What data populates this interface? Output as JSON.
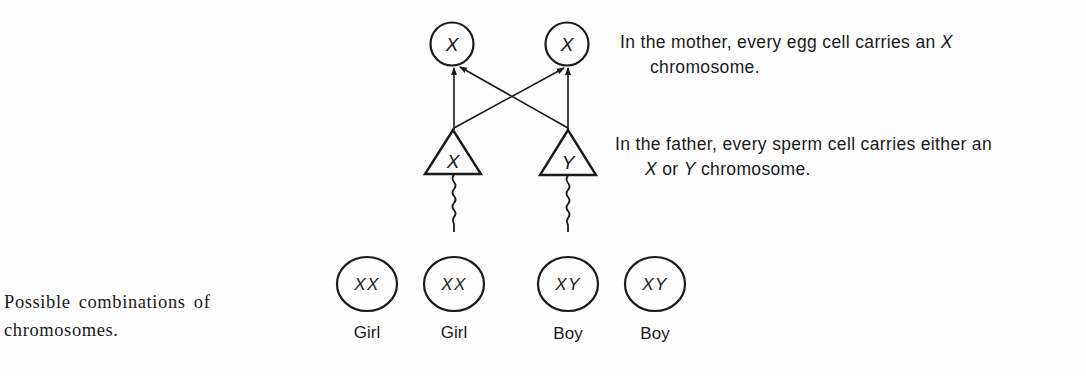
{
  "diagram": {
    "colors": {
      "background": "#fdfdfd",
      "ink": "#1a1a1a"
    },
    "mother": {
      "egg_cells": [
        {
          "label": "X",
          "shape": "circle"
        },
        {
          "label": "X",
          "shape": "circle"
        }
      ],
      "description_line1": "In the mother, every egg cell carries an ",
      "description_line1_italic": "X",
      "description_line2": "chromosome."
    },
    "father": {
      "sperm_cells": [
        {
          "label": "X",
          "shape": "triangle"
        },
        {
          "label": "Y",
          "shape": "triangle"
        }
      ],
      "description_line1": "In the father, every sperm cell carries either an",
      "description_line2_italic_a": "X",
      "description_line2_mid": " or ",
      "description_line2_italic_b": "Y",
      "description_line2_end": " chromosome."
    },
    "offspring": {
      "caption_line1": "Possible combinations of",
      "caption_line2": "chromosomes.",
      "combinations": [
        {
          "genotype": "XX",
          "sex": "Girl"
        },
        {
          "genotype": "XX",
          "sex": "Girl"
        },
        {
          "genotype": "XY",
          "sex": "Boy"
        },
        {
          "genotype": "XY",
          "sex": "Boy"
        }
      ]
    },
    "connections": [
      {
        "from": "sperm-X",
        "to": "egg-1"
      },
      {
        "from": "sperm-X",
        "to": "egg-2"
      },
      {
        "from": "sperm-Y",
        "to": "egg-1"
      },
      {
        "from": "sperm-Y",
        "to": "egg-2"
      }
    ]
  }
}
